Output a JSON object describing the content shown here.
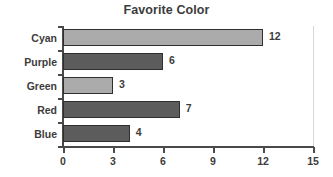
{
  "chart_data": {
    "type": "bar",
    "orientation": "horizontal",
    "title": "Favorite Color",
    "xlabel": "",
    "ylabel": "",
    "categories": [
      "Cyan",
      "Purple",
      "Green",
      "Red",
      "Blue"
    ],
    "values": [
      12,
      6,
      3,
      7,
      4
    ],
    "value_labels": [
      "12",
      "6",
      "3",
      "7",
      "4"
    ],
    "bar_colors": [
      "#ababab",
      "#5c5c5c",
      "#ababab",
      "#5c5c5c",
      "#5c5c5c"
    ],
    "bar_shades": [
      "light",
      "dark",
      "light",
      "dark",
      "dark"
    ],
    "bar_outline_color": "#2f2f2f",
    "xlim": [
      0,
      15
    ],
    "xticks": [
      0,
      3,
      6,
      9,
      12,
      15
    ],
    "xtick_labels": [
      "0",
      "3",
      "6",
      "9",
      "12",
      "15"
    ],
    "grid": false,
    "legend": null,
    "axis_color": "#4a4a4a",
    "text_color": "#3c3c3c",
    "background": "#ffffff"
  }
}
